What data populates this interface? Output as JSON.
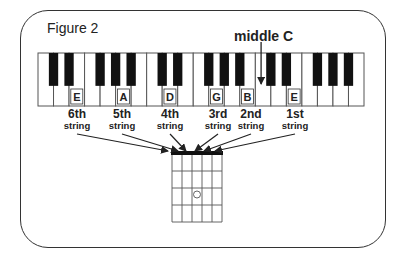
{
  "figure": {
    "title": "Figure 2",
    "middle_c_label": "middle C"
  },
  "keyboard": {
    "white_keys": [
      "C",
      "D",
      "E",
      "F",
      "G",
      "A",
      "B",
      "C",
      "D",
      "E",
      "F",
      "G",
      "A",
      "B",
      "C",
      "D",
      "E",
      "F",
      "G",
      "A",
      "B"
    ],
    "labeled_keys": [
      {
        "index": 2,
        "note": "E"
      },
      {
        "index": 5,
        "note": "A"
      },
      {
        "index": 8,
        "note": "D"
      },
      {
        "index": 11,
        "note": "G"
      },
      {
        "index": 13,
        "note": "B"
      },
      {
        "index": 16,
        "note": "E"
      }
    ],
    "middle_c_index": 14
  },
  "strings": [
    {
      "num": "6th",
      "word": "string"
    },
    {
      "num": "5th",
      "word": "string"
    },
    {
      "num": "4th",
      "word": "string"
    },
    {
      "num": "3rd",
      "word": "string"
    },
    {
      "num": "2nd",
      "word": "string"
    },
    {
      "num": "1st",
      "word": "string"
    }
  ],
  "fretboard": {
    "strings": 6,
    "frets": 4,
    "dot": {
      "string_gap": 3,
      "fret": 3
    }
  }
}
